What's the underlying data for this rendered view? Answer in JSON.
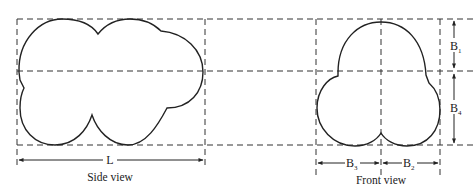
{
  "side_view": {
    "caption": "Side view",
    "dimension_label": "L"
  },
  "front_view": {
    "caption": "Front view",
    "dimensions": {
      "B1": {
        "base": "B",
        "sub": "1"
      },
      "B2": {
        "base": "B",
        "sub": "2"
      },
      "B3": {
        "base": "B",
        "sub": "3"
      },
      "B4": {
        "base": "B",
        "sub": "4"
      }
    }
  },
  "colors": {
    "stroke": "#222222",
    "dashed": "#333333",
    "background": "#ffffff"
  }
}
